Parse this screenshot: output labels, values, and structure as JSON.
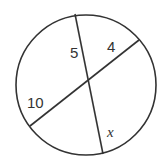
{
  "diagram": {
    "type": "intersecting-chords-in-circle",
    "circle": {
      "cx": 86,
      "cy": 85,
      "r": 70
    },
    "chords": [
      {
        "name": "chord-a",
        "from": [
          75,
          14
        ],
        "to": [
          103,
          154
        ]
      },
      {
        "name": "chord-b",
        "from": [
          30,
          126
        ],
        "to": [
          139,
          40
        ]
      }
    ],
    "labels": {
      "segment_top": "5",
      "segment_right": "4",
      "segment_left": "10",
      "segment_bottom": "x"
    },
    "colors": {
      "stroke": "#333333",
      "background": "#ffffff"
    }
  }
}
